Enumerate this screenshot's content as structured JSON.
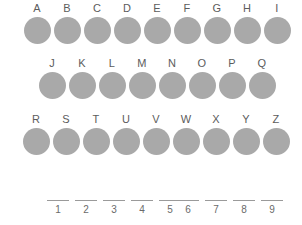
{
  "page": {
    "background_color": "#ffffff",
    "circle_color": "#a9a9a9",
    "letter_color": "#5c5c5c",
    "blank_line_color": "#9a9a9a",
    "number_color": "#6a6a6a"
  },
  "letter_rows": [
    {
      "row_id": "row-1",
      "letters": [
        "A",
        "B",
        "C",
        "D",
        "E",
        "F",
        "G",
        "H",
        "I"
      ]
    },
    {
      "row_id": "row-2",
      "letters": [
        "J",
        "K",
        "L",
        "M",
        "N",
        "O",
        "P",
        "Q"
      ]
    },
    {
      "row_id": "row-3",
      "letters": [
        "R",
        "S",
        "T",
        "U",
        "V",
        "W",
        "X",
        "Y",
        "Z"
      ]
    }
  ],
  "answer_blanks": {
    "groups": [
      {
        "group_id": "group-a",
        "numbers": [
          "1",
          "2",
          "3",
          "4",
          "5"
        ]
      },
      {
        "group_id": "group-b",
        "numbers": [
          "6",
          "7",
          "8",
          "9"
        ]
      }
    ]
  }
}
